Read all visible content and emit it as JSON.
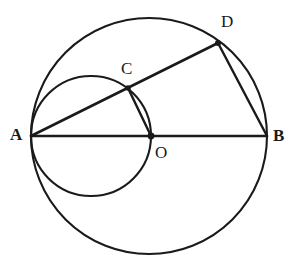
{
  "figure": {
    "background_color": "#ffffff",
    "stroke_color": "#1a1a1a",
    "label_color": "#1a1a1a"
  },
  "labels": {
    "a": "A",
    "b": "B",
    "o": "O",
    "c": "C",
    "d": "D"
  },
  "chart_data": {
    "type": "diagram",
    "width": 295,
    "height": 274,
    "points": [
      {
        "name": "A",
        "x": 31,
        "y": 136,
        "label": "A",
        "label_x": 10,
        "label_y": 126,
        "marked": false
      },
      {
        "name": "B",
        "x": 267,
        "y": 136,
        "label": "B",
        "label_x": 273,
        "label_y": 127,
        "marked": false
      },
      {
        "name": "O",
        "x": 151,
        "y": 136,
        "label": "O",
        "label_x": 155,
        "label_y": 144,
        "marked": true
      },
      {
        "name": "C",
        "x": 128,
        "y": 88,
        "label": "C",
        "label_x": 121,
        "label_y": 60,
        "marked": true
      },
      {
        "name": "D",
        "x": 218,
        "y": 43,
        "label": "D",
        "label_x": 221,
        "label_y": 13,
        "marked": true
      }
    ],
    "circles": [
      {
        "name": "outer-circle",
        "cx": 149,
        "cy": 136,
        "r": 118,
        "stroke_width": 2.1
      },
      {
        "name": "inner-circle",
        "cx": 91,
        "cy": 136,
        "r": 60,
        "stroke_width": 2.1
      }
    ],
    "segments": [
      {
        "name": "AB",
        "from": "A",
        "to": "B",
        "x1": 31,
        "y1": 136,
        "x2": 267,
        "y2": 136,
        "stroke_width": 2.6
      },
      {
        "name": "AD",
        "from": "A",
        "to": "D",
        "x1": 31,
        "y1": 136,
        "x2": 218,
        "y2": 43,
        "stroke_width": 2.6
      },
      {
        "name": "DB",
        "from": "D",
        "to": "B",
        "x1": 218,
        "y1": 43,
        "x2": 267,
        "y2": 136,
        "stroke_width": 2.4
      },
      {
        "name": "CO",
        "from": "C",
        "to": "O",
        "x1": 128,
        "y1": 88,
        "x2": 151,
        "y2": 136,
        "stroke_width": 2.4
      }
    ],
    "xlabel": "",
    "ylabel": "",
    "grid": false,
    "legend": false
  }
}
